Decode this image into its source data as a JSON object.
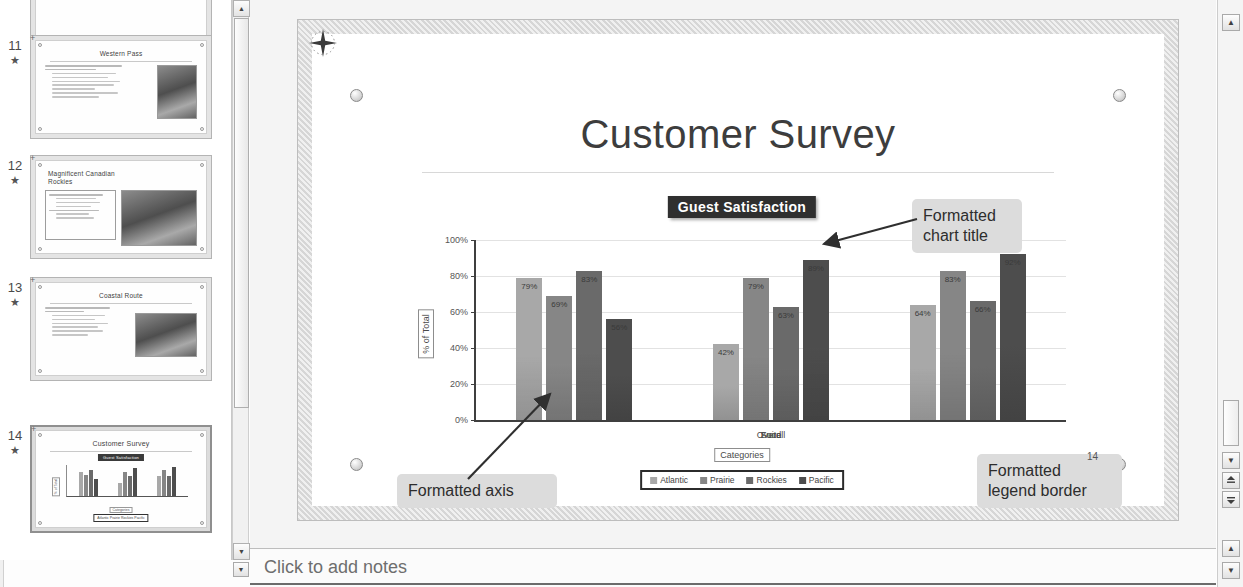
{
  "app": {
    "notes_placeholder": "Click to add notes",
    "slide_number_display": "14"
  },
  "thumbnails": [
    {
      "number": "10",
      "title": "",
      "type": "partial",
      "selected": false,
      "star": "★"
    },
    {
      "number": "11",
      "title": "Western Pass",
      "type": "bullets-image",
      "selected": false,
      "star": "★"
    },
    {
      "number": "12",
      "title": "Magnificent Canadian Rockies",
      "type": "boxed-bullets-image",
      "selected": false,
      "star": "★"
    },
    {
      "number": "13",
      "title": "Coastal Route",
      "type": "bullets-image",
      "selected": false,
      "star": "★"
    },
    {
      "number": "14",
      "title": "Customer Survey",
      "type": "chart",
      "selected": true,
      "star": "★"
    }
  ],
  "slide": {
    "title": "Customer Survey",
    "number": "14"
  },
  "callouts": [
    {
      "id": "chart-title",
      "line1": "Formatted",
      "line2": "chart title"
    },
    {
      "id": "axis",
      "line1": "Formatted axis",
      "line2": ""
    },
    {
      "id": "legend",
      "line1": "Formatted",
      "line2": "legend border"
    }
  ],
  "chart_data": {
    "type": "bar",
    "title": "Guest Satisfaction",
    "xlabel": "Categories",
    "ylabel": "% of Total",
    "ylim": [
      0,
      100
    ],
    "ytick_labels": [
      "0%",
      "20%",
      "40%",
      "60%",
      "80%",
      "100%"
    ],
    "ytick_values": [
      0,
      20,
      40,
      60,
      80,
      100
    ],
    "grid": true,
    "legend_position": "bottom",
    "legend_border": true,
    "categories": [
      "Suite",
      "Food",
      "Overall"
    ],
    "series": [
      {
        "name": "Atlantic",
        "color": "#a8a8a8",
        "values": [
          79,
          42,
          64
        ],
        "labels": [
          "79%",
          "42%",
          "64%"
        ]
      },
      {
        "name": "Prairie",
        "color": "#868686",
        "values": [
          69,
          79,
          83
        ],
        "labels": [
          "69%",
          "79%",
          "83%"
        ]
      },
      {
        "name": "Rockies",
        "color": "#6a6a6a",
        "values": [
          83,
          63,
          66
        ],
        "labels": [
          "83%",
          "63%",
          "66%"
        ]
      },
      {
        "name": "Pacific",
        "color": "#4d4d4d",
        "values": [
          56,
          89,
          92
        ],
        "labels": [
          "56%",
          "89%",
          "92%"
        ]
      }
    ]
  },
  "icons": {
    "move_badge": "compass-move-icon",
    "scroll_up": "▲",
    "scroll_down": "▼",
    "prev_slide": "⬆",
    "next_slide": "⬇"
  },
  "scrollbars": {
    "thumb_up": "▲",
    "thumb_down": "▼",
    "right_up": "▲",
    "right_down": "▼",
    "prev_label": "▴",
    "next_label": "▾"
  }
}
